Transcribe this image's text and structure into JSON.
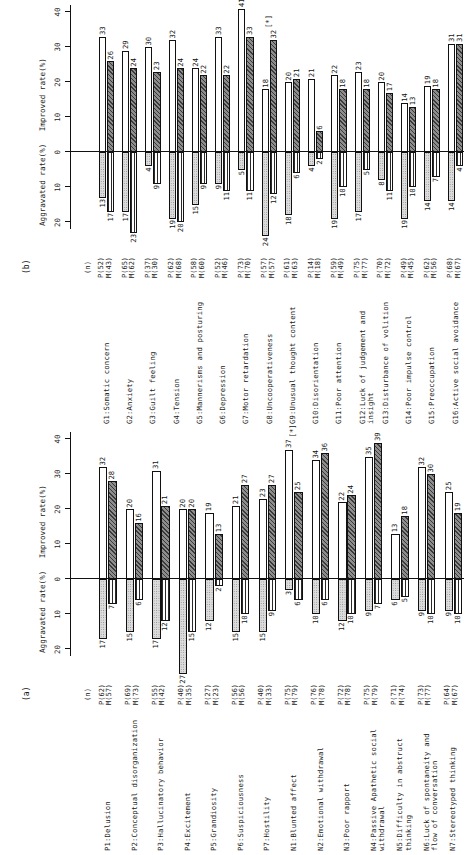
{
  "figure": {
    "orientation": "rotated-90",
    "panels": [
      {
        "tag": "(a)",
        "axes": {
          "left_header": "Aggravated rate(%)",
          "right_header": "Improved rate(%)",
          "n_header": "(n)",
          "neg_ticks": [
            20,
            10,
            0
          ],
          "pos_ticks": [
            0,
            10,
            20,
            30,
            40
          ],
          "axis_min": -25,
          "axis_max": 42
        },
        "rows": [
          {
            "label": "P1:Delusion",
            "p_n": "P(62)",
            "m_n": "M(57)",
            "p_imp": 32,
            "m_imp": 28,
            "p_agg": 17,
            "m_agg": 7,
            "star": false
          },
          {
            "label": "P2:Conceptual disorganization",
            "p_n": "P(69)",
            "m_n": "M(73)",
            "p_imp": 20,
            "m_imp": 16,
            "p_agg": 15,
            "m_agg": 6,
            "star": false
          },
          {
            "label": "P3:Hallucinatory behavior",
            "p_n": "P(55)",
            "m_n": "M(42)",
            "p_imp": 31,
            "m_imp": 21,
            "p_agg": 17,
            "m_agg": 12,
            "star": false
          },
          {
            "label": "P4:Excitement",
            "p_n": "P(40)",
            "m_n": "M(35)",
            "p_imp": 20,
            "m_imp": 20,
            "p_agg": 27,
            "m_agg": 15,
            "star": false
          },
          {
            "label": "P5:Grandiosity",
            "p_n": "P(27)",
            "m_n": "M(23)",
            "p_imp": 19,
            "m_imp": 13,
            "p_agg": 12,
            "m_agg": 2,
            "star": false
          },
          {
            "label": "P6:Suspiciousness",
            "p_n": "P(56)",
            "m_n": "M(56)",
            "p_imp": 21,
            "m_imp": 27,
            "p_agg": 15,
            "m_agg": 10,
            "star": false
          },
          {
            "label": "P7:Hostility",
            "p_n": "P(40)",
            "m_n": "M(33)",
            "p_imp": 23,
            "m_imp": 27,
            "p_agg": 15,
            "m_agg": 9,
            "star": false
          },
          {
            "label": "N1:Blunted affect",
            "p_n": "P(75)",
            "m_n": "M(79)",
            "p_imp": 37,
            "m_imp": 25,
            "p_agg": 3,
            "m_agg": 6,
            "star": true
          },
          {
            "label": "N2:Emotional withdrawal",
            "p_n": "P(76)",
            "m_n": "M(78)",
            "p_imp": 34,
            "m_imp": 36,
            "p_agg": 10,
            "m_agg": 6,
            "star": false
          },
          {
            "label": "N3:Poor rapport",
            "p_n": "P(72)",
            "m_n": "M(78)",
            "p_imp": 22,
            "m_imp": 24,
            "p_agg": 12,
            "m_agg": 10,
            "star": false
          },
          {
            "label": "N4:Passive Apathetic social\n     withdrawal",
            "p_n": "P(75)",
            "m_n": "M(79)",
            "p_imp": 35,
            "m_imp": 39,
            "p_agg": 9,
            "m_agg": 7,
            "star": false
          },
          {
            "label": "N5:Difficulty in abstruct\n     thinking",
            "p_n": "P(71)",
            "m_n": "M(74)",
            "p_imp": 13,
            "m_imp": 18,
            "p_agg": 6,
            "m_agg": 5,
            "star": false
          },
          {
            "label": "N6:Luck of spontaneity and\n     flow of conversation",
            "p_n": "P(73)",
            "m_n": "M(77)",
            "p_imp": 32,
            "m_imp": 30,
            "p_agg": 9,
            "m_agg": 10,
            "star": false
          },
          {
            "label": "N7:Stereotyped thinking",
            "p_n": "P(64)",
            "m_n": "M(67)",
            "p_imp": 25,
            "m_imp": 19,
            "p_agg": 9,
            "m_agg": 10,
            "star": false
          }
        ]
      },
      {
        "tag": "(b)",
        "axes": {
          "left_header": "Aggravated rate(%)",
          "right_header": "Improved rate(%)",
          "n_header": "(n)",
          "neg_ticks": [
            20,
            10,
            0
          ],
          "pos_ticks": [
            0,
            10,
            20,
            30,
            40
          ],
          "axis_min": -25,
          "axis_max": 42
        },
        "rows": [
          {
            "label": "G1:Somatic concern",
            "p_n": "P(52)",
            "m_n": "M(43)",
            "p_imp": 33,
            "m_imp": 26,
            "p_agg": 13,
            "m_agg": 17,
            "star": false
          },
          {
            "label": "G2:Anxiety",
            "p_n": "P(65)",
            "m_n": "M(62)",
            "p_imp": 29,
            "m_imp": 24,
            "p_agg": 17,
            "m_agg": 23,
            "star": false
          },
          {
            "label": "G3:Guilt feeling",
            "p_n": "P(37)",
            "m_n": "M(30)",
            "p_imp": 30,
            "m_imp": 23,
            "p_agg": 4,
            "m_agg": 9,
            "star": false
          },
          {
            "label": "G4:Tension",
            "p_n": "P(62)",
            "m_n": "M(68)",
            "p_imp": 32,
            "m_imp": 24,
            "p_agg": 19,
            "m_agg": 20,
            "star": false
          },
          {
            "label": "G5:Mannerisms and posturing",
            "p_n": "P(58)",
            "m_n": "M(60)",
            "p_imp": 24,
            "m_imp": 22,
            "p_agg": 15,
            "m_agg": 9,
            "star": false
          },
          {
            "label": "G6:Depression",
            "p_n": "P(52)",
            "m_n": "M(46)",
            "p_imp": 33,
            "m_imp": 22,
            "p_agg": 9,
            "m_agg": 11,
            "star": false
          },
          {
            "label": "G7:Motor retardation",
            "p_n": "P(73)",
            "m_n": "M(70)",
            "p_imp": 41,
            "m_imp": 33,
            "p_agg": 5,
            "m_agg": 11,
            "star": false
          },
          {
            "label": "G8:Uncooperativeness",
            "p_n": "P(57)",
            "m_n": "M(57)",
            "p_imp": 18,
            "m_imp": 32,
            "p_agg": 24,
            "m_agg": 12,
            "star": true
          },
          {
            "label": "G9:Unusual thought content",
            "p_n": "P(61)",
            "m_n": "M(63)",
            "p_imp": 20,
            "m_imp": 21,
            "p_agg": 18,
            "m_agg": 6,
            "star": false
          },
          {
            "label": "G10:Disorientation",
            "p_n": "P(14)",
            "m_n": "M(18)",
            "p_imp": 21,
            "m_imp": 6,
            "p_agg": 4,
            "m_agg": 2,
            "star": false
          },
          {
            "label": "G11:Poor attention",
            "p_n": "P(59)",
            "m_n": "M(49)",
            "p_imp": 22,
            "m_imp": 18,
            "p_agg": 19,
            "m_agg": 10,
            "star": false
          },
          {
            "label": "G12:Luck of judgement and\n      insight",
            "p_n": "P(75)",
            "m_n": "M(77)",
            "p_imp": 23,
            "m_imp": 18,
            "p_agg": 17,
            "m_agg": 5,
            "star": false
          },
          {
            "label": "G13:Disturbance of volition",
            "p_n": "P(70)",
            "m_n": "M(72)",
            "p_imp": 20,
            "m_imp": 17,
            "p_agg": 8,
            "m_agg": 11,
            "star": false
          },
          {
            "label": "G14:Poor impulse control",
            "p_n": "P(49)",
            "m_n": "M(45)",
            "p_imp": 14,
            "m_imp": 13,
            "p_agg": 19,
            "m_agg": 10,
            "star": false
          },
          {
            "label": "G15:Preoccupation",
            "p_n": "P(62)",
            "m_n": "M(56)",
            "p_imp": 19,
            "m_imp": 18,
            "p_agg": 14,
            "m_agg": 7,
            "star": false
          },
          {
            "label": "G16:Active social avoidance",
            "p_n": "P(68)",
            "m_n": "M(67)",
            "p_imp": 31,
            "m_imp": 31,
            "p_agg": 14,
            "m_agg": 4,
            "star": false
          }
        ]
      }
    ]
  },
  "chart_data": {
    "type": "bar",
    "title": "",
    "xlabel": "",
    "ylabel": "Rate (%)",
    "orientation": "horizontal-diverging",
    "axis_headers": [
      "Aggravated rate(%)",
      "Improved rate(%)"
    ],
    "tick_labels_negative": [
      "20",
      "10",
      "0"
    ],
    "tick_labels_positive": [
      "0",
      "10",
      "20",
      "30",
      "40"
    ],
    "ylim": [
      -25,
      42
    ],
    "grid": false,
    "legend": [
      "P (white / stipple)",
      "M (hatched / horizontal-line)"
    ],
    "annotations": [
      "[*]"
    ],
    "panels": [
      {
        "name": "(a)",
        "categories": [
          "P1:Delusion",
          "P2:Conceptual disorganization",
          "P3:Hallucinatory behavior",
          "P4:Excitement",
          "P5:Grandiosity",
          "P6:Suspiciousness",
          "P7:Hostility",
          "N1:Blunted affect",
          "N2:Emotional withdrawal",
          "N3:Poor rapport",
          "N4:Passive Apathetic social withdrawal",
          "N5:Difficulty in abstruct thinking",
          "N6:Luck of spontaneity and flow of conversation",
          "N7:Stereotyped thinking"
        ],
        "n_values": [
          [
            "P(62)",
            "M(57)"
          ],
          [
            "P(69)",
            "M(73)"
          ],
          [
            "P(55)",
            "M(42)"
          ],
          [
            "P(40)",
            "M(35)"
          ],
          [
            "P(27)",
            "M(23)"
          ],
          [
            "P(56)",
            "M(56)"
          ],
          [
            "P(40)",
            "M(33)"
          ],
          [
            "P(75)",
            "M(79)"
          ],
          [
            "P(76)",
            "M(78)"
          ],
          [
            "P(72)",
            "M(78)"
          ],
          [
            "P(75)",
            "M(79)"
          ],
          [
            "P(71)",
            "M(74)"
          ],
          [
            "P(73)",
            "M(77)"
          ],
          [
            "P(64)",
            "M(67)"
          ]
        ],
        "series": [
          {
            "name": "P improved rate(%)",
            "values": [
              32,
              20,
              31,
              20,
              19,
              21,
              23,
              37,
              34,
              22,
              35,
              13,
              32,
              25
            ]
          },
          {
            "name": "M improved rate(%)",
            "values": [
              28,
              16,
              21,
              20,
              13,
              27,
              27,
              25,
              36,
              24,
              39,
              18,
              30,
              19
            ]
          },
          {
            "name": "P aggravated rate(%)",
            "values": [
              17,
              15,
              17,
              27,
              12,
              15,
              15,
              3,
              10,
              12,
              9,
              6,
              9,
              9
            ]
          },
          {
            "name": "M aggravated rate(%)",
            "values": [
              7,
              6,
              12,
              15,
              2,
              10,
              9,
              6,
              6,
              10,
              7,
              5,
              10,
              10
            ]
          }
        ],
        "significant": [
          "N1:Blunted affect"
        ]
      },
      {
        "name": "(b)",
        "categories": [
          "G1:Somatic concern",
          "G2:Anxiety",
          "G3:Guilt feeling",
          "G4:Tension",
          "G5:Mannerisms and posturing",
          "G6:Depression",
          "G7:Motor retardation",
          "G8:Uncooperativeness",
          "G9:Unusual thought content",
          "G10:Disorientation",
          "G11:Poor attention",
          "G12:Luck of judgement and insight",
          "G13:Disturbance of volition",
          "G14:Poor impulse control",
          "G15:Preoccupation",
          "G16:Active social avoidance"
        ],
        "n_values": [
          [
            "P(52)",
            "M(43)"
          ],
          [
            "P(65)",
            "M(62)"
          ],
          [
            "P(37)",
            "M(30)"
          ],
          [
            "P(62)",
            "M(68)"
          ],
          [
            "P(58)",
            "M(60)"
          ],
          [
            "P(52)",
            "M(46)"
          ],
          [
            "P(73)",
            "M(70)"
          ],
          [
            "P(57)",
            "M(57)"
          ],
          [
            "P(61)",
            "M(63)"
          ],
          [
            "P(14)",
            "M(18)"
          ],
          [
            "P(59)",
            "M(49)"
          ],
          [
            "P(75)",
            "M(77)"
          ],
          [
            "P(70)",
            "M(72)"
          ],
          [
            "P(49)",
            "M(45)"
          ],
          [
            "P(62)",
            "M(56)"
          ],
          [
            "P(68)",
            "M(67)"
          ]
        ],
        "series": [
          {
            "name": "P improved rate(%)",
            "values": [
              33,
              29,
              30,
              32,
              24,
              33,
              41,
              18,
              20,
              21,
              22,
              23,
              20,
              14,
              19,
              31
            ]
          },
          {
            "name": "M improved rate(%)",
            "values": [
              26,
              24,
              23,
              24,
              22,
              22,
              33,
              32,
              21,
              6,
              18,
              18,
              17,
              13,
              18,
              31
            ]
          },
          {
            "name": "P aggravated rate(%)",
            "values": [
              13,
              17,
              4,
              19,
              15,
              9,
              5,
              24,
              18,
              4,
              19,
              17,
              8,
              19,
              14,
              14
            ]
          },
          {
            "name": "M aggravated rate(%)",
            "values": [
              17,
              23,
              9,
              20,
              9,
              11,
              11,
              12,
              6,
              2,
              10,
              5,
              11,
              10,
              7,
              4
            ]
          }
        ],
        "significant": [
          "G8:Uncooperativeness"
        ]
      }
    ]
  }
}
